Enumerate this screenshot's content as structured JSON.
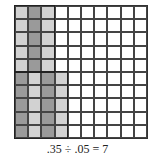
{
  "diagram": {
    "type": "hundredths-grid",
    "rows": 10,
    "cols": 10,
    "colors": {
      "empty": "#ffffff",
      "light": "#d2d2d2",
      "dark": "#9a9a9a",
      "line": "#444444"
    },
    "shaded_groups": [
      {
        "col": 0,
        "row_start": 0,
        "row_end": 4,
        "shade": "light"
      },
      {
        "col": 1,
        "row_start": 0,
        "row_end": 4,
        "shade": "dark"
      },
      {
        "col": 2,
        "row_start": 0,
        "row_end": 4,
        "shade": "light"
      },
      {
        "col": 0,
        "row_start": 5,
        "row_end": 9,
        "shade": "dark"
      },
      {
        "col": 1,
        "row_start": 5,
        "row_end": 9,
        "shade": "light"
      },
      {
        "col": 2,
        "row_start": 5,
        "row_end": 9,
        "shade": "dark"
      },
      {
        "col": 3,
        "row_start": 5,
        "row_end": 9,
        "shade": "light"
      }
    ],
    "caption": ".35 ÷ .05 = 7"
  }
}
